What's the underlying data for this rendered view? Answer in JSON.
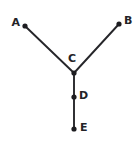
{
  "figure": {
    "background_color": "#ffffff",
    "stroke_color": "#26262a",
    "dot_color": "#1d1d21",
    "label_color": "#232327",
    "width": 137,
    "height": 147
  },
  "points": [
    {
      "id": "A",
      "label": "A",
      "x": 25,
      "y": 26,
      "label_x": 20,
      "label_y": 23,
      "label_anchor": "left"
    },
    {
      "id": "B",
      "label": "B",
      "x": 119,
      "y": 24,
      "label_x": 124,
      "label_y": 21,
      "label_anchor": "right"
    },
    {
      "id": "C",
      "label": "C",
      "x": 74,
      "y": 73,
      "label_x": 72,
      "label_y": 59,
      "label_anchor": "mid"
    },
    {
      "id": "D",
      "label": "D",
      "x": 74,
      "y": 97,
      "label_x": 79,
      "label_y": 96,
      "label_anchor": "right"
    },
    {
      "id": "E",
      "label": "E",
      "x": 74,
      "y": 129,
      "label_x": 80,
      "label_y": 128,
      "label_anchor": "right"
    }
  ],
  "segments": [
    {
      "id": "AC",
      "from": "A",
      "to": "C",
      "x1": 25,
      "y1": 26,
      "x2": 74,
      "y2": 73
    },
    {
      "id": "BC",
      "from": "B",
      "to": "C",
      "x1": 119,
      "y1": 24,
      "x2": 74,
      "y2": 73
    },
    {
      "id": "CD",
      "from": "C",
      "to": "D",
      "x1": 74,
      "y1": 73,
      "x2": 74,
      "y2": 97
    },
    {
      "id": "DE",
      "from": "D",
      "to": "E",
      "x1": 74,
      "y1": 97,
      "x2": 74,
      "y2": 129
    }
  ],
  "dot_radius": 2.6
}
